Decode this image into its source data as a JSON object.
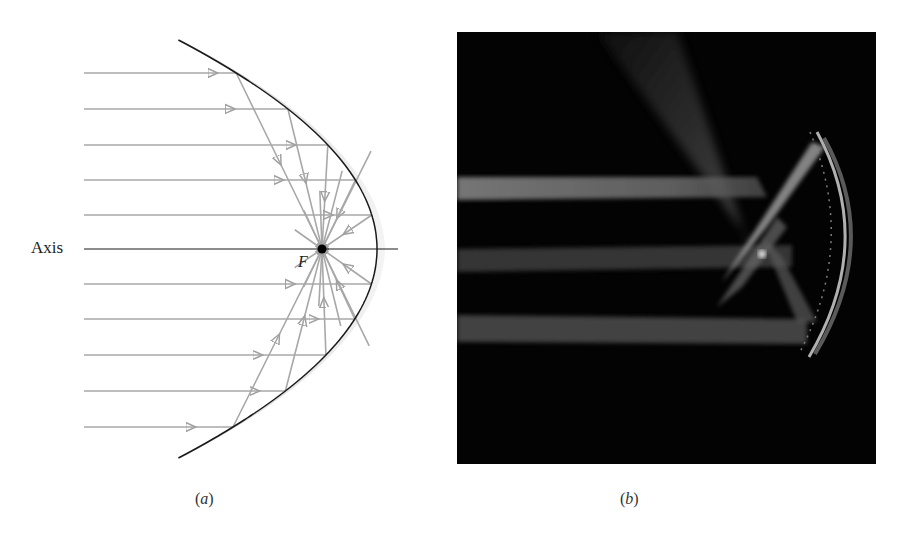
{
  "figure_a": {
    "axis_label": "Axis",
    "focus_label": "F",
    "caption_open": "(",
    "caption_letter": "a",
    "caption_close": ")",
    "colors": {
      "ray": "#a8a8a8",
      "mirror_line": "#1a1a1a",
      "mirror_shade": "#c4c4c4",
      "axis": "#1a1a1a",
      "focus_dot": "#000000"
    },
    "ray_y_positions": [
      73,
      109,
      145,
      180,
      215,
      284,
      319,
      355,
      391,
      427
    ],
    "focus": {
      "x": 322,
      "y": 249
    },
    "vertex": {
      "x": 377,
      "y": 249
    }
  },
  "figure_b": {
    "description": "Photograph of parallel light beams reflecting from a concave mirror and converging at the focal point",
    "caption_open": "(",
    "caption_letter": "b",
    "caption_close": ")",
    "colors": {
      "background": "#030303",
      "beam": "#7a7a7a"
    }
  }
}
